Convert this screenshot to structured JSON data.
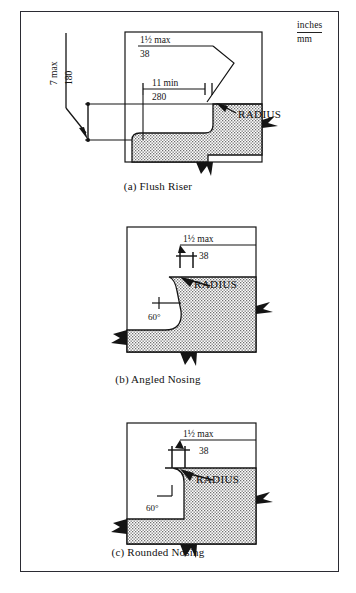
{
  "figure": {
    "legend": {
      "numerator": "inches",
      "denominator": "mm"
    },
    "panels": [
      {
        "id": "flush-riser",
        "caption": "(a) Flush Riser",
        "annotations": [
          {
            "name": "tread-depth-inches",
            "text": "1½ max"
          },
          {
            "name": "tread-depth-mm",
            "text": "38"
          },
          {
            "name": "run-inches",
            "text": "11 min"
          },
          {
            "name": "run-mm",
            "text": "280"
          },
          {
            "name": "riser-height-inches",
            "text": "7 max"
          },
          {
            "name": "riser-height-mm",
            "text": "180"
          },
          {
            "name": "radius-callout",
            "text": "RADIUS"
          }
        ]
      },
      {
        "id": "angled-nosing",
        "caption": "(b) Angled Nosing",
        "annotations": [
          {
            "name": "nosing-projection-inches",
            "text": "1½ max"
          },
          {
            "name": "nosing-projection-mm",
            "text": "38"
          },
          {
            "name": "nosing-angle",
            "text": "60°"
          },
          {
            "name": "radius-callout",
            "text": "RADIUS"
          }
        ]
      },
      {
        "id": "rounded-nosing",
        "caption": "(c) Rounded Nosing",
        "annotations": [
          {
            "name": "nosing-projection-inches",
            "text": "1½ max"
          },
          {
            "name": "nosing-projection-mm",
            "text": "38"
          },
          {
            "name": "nosing-angle",
            "text": "60°"
          },
          {
            "name": "radius-callout",
            "text": "RADIUS"
          }
        ]
      }
    ]
  },
  "colors": {
    "ink": "#141414",
    "frame": "#2b2b33",
    "paper": "#ffffff",
    "stipple": "#6f6f6f"
  }
}
